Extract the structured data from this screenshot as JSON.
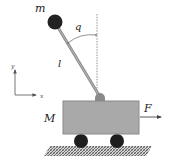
{
  "diagram": {
    "labels": {
      "pendulum_mass": "m",
      "angle": "q",
      "rod_length": "l",
      "cart_mass": "M",
      "force": "F",
      "axis_x": "x",
      "axis_y": "y"
    },
    "colors": {
      "cart_fill": "#a9a9a9",
      "cart_stroke": "#8a8a8a",
      "rod": "#8f8f8f",
      "ball": "#222222",
      "wheel": "#1e1e1e",
      "ground_hatch": "#6f6f6f",
      "arrow": "#444444",
      "dashed_line": "#777777"
    }
  }
}
